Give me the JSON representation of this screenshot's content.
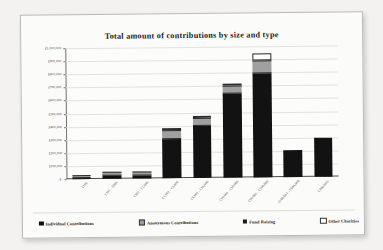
{
  "page": {
    "background": "#f2f1ef",
    "card_background": "#fbfbfa",
    "border_color": "#b9b9b6"
  },
  "bleed_text": "the data presented in the table above shows that the larger the size of the donation the greater the total amount contributed overall",
  "chart_data": {
    "type": "bar",
    "subtype": "stacked-bar",
    "title": "Total amount of contributions by size and type",
    "xlabel": "",
    "ylabel": "",
    "grid": true,
    "legend_position": "bottom",
    "ylim": [
      0,
      1000000
    ],
    "ytick_values": [
      0,
      100000,
      200000,
      300000,
      400000,
      500000,
      600000,
      700000,
      800000,
      900000,
      1000000
    ],
    "ytick_labels": [
      "£-",
      "£100,000",
      "£200,000",
      "£300,000",
      "£400,000",
      "£500,000",
      "£600,000",
      "£700,000",
      "£800,000",
      "£900,000",
      "£1,000,000"
    ],
    "categories": [
      "£100",
      "£101 - £500",
      "£501 - £1,000",
      "£1,001 - £5,000",
      "£5,001 - £10,000",
      "£10,001 - £50,000",
      "£50,001 - £100,000",
      "£100,001 - £500,000",
      "£500,001+"
    ],
    "series": [
      {
        "name": "Individual Contributions",
        "color": "#121212",
        "values": [
          8000,
          24000,
          26000,
          300000,
          395000,
          640000,
          795000,
          205000,
          300000
        ]
      },
      {
        "name": "Anonymous Contributions",
        "color": "#a0a0a0",
        "values": [
          2000,
          14000,
          14000,
          55000,
          45000,
          50000,
          85000,
          0,
          0
        ]
      },
      {
        "name": "Fund Raising",
        "color": "#2e2e2e",
        "values": [
          0,
          0,
          0,
          0,
          0,
          0,
          0,
          0,
          0
        ]
      },
      {
        "name": "Other Charities",
        "color": "#fdfdfc",
        "values": [
          0,
          0,
          0,
          8000,
          10000,
          10000,
          55000,
          0,
          0
        ]
      }
    ],
    "totals": [
      10000,
      38000,
      40000,
      363000,
      450000,
      700000,
      935000,
      205000,
      300000
    ]
  },
  "legend": {
    "items": [
      {
        "label": "Individual Contributions",
        "swatch": "sw-ind"
      },
      {
        "label": "Anonymous Contributions",
        "swatch": "sw-anon"
      },
      {
        "label": "Fund Raising",
        "swatch": "sw-fund"
      },
      {
        "label": "Other Charities",
        "swatch": "sw-other"
      }
    ]
  }
}
